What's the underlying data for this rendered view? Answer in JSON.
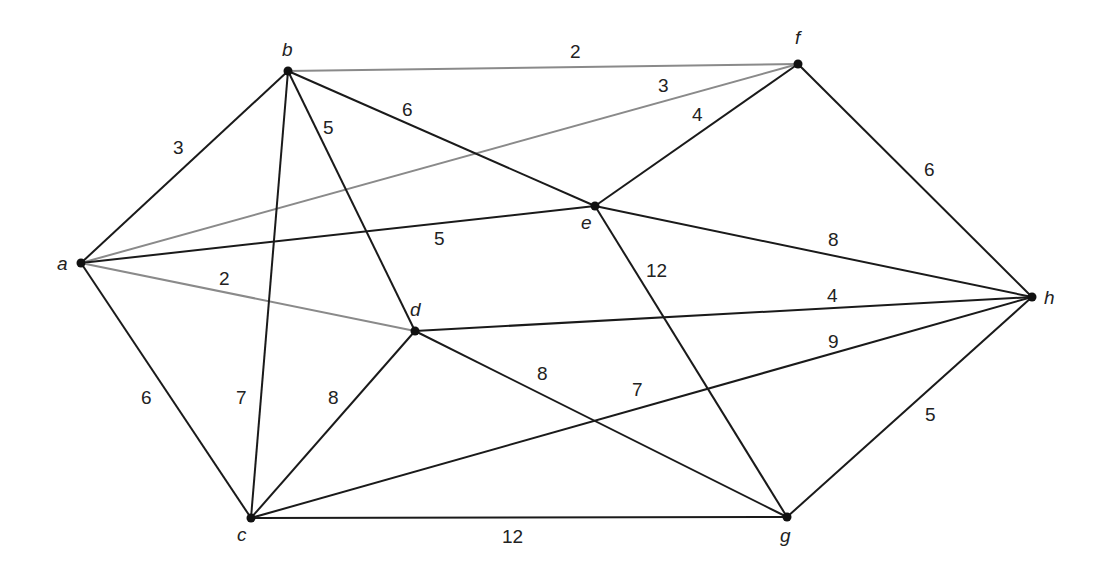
{
  "graph": {
    "type": "weighted-undirected-graph",
    "colors": {
      "edge_black": "#1a1a1a",
      "edge_gray": "#8a8a8a",
      "node": "#111111",
      "background": "#ffffff"
    },
    "nodes": [
      {
        "id": "a",
        "label": "a",
        "x": 81,
        "y": 263,
        "lx": 57,
        "ly": 270
      },
      {
        "id": "b",
        "label": "b",
        "x": 288,
        "y": 71,
        "lx": 282,
        "ly": 56
      },
      {
        "id": "c",
        "label": "c",
        "x": 251,
        "y": 518,
        "lx": 237,
        "ly": 541
      },
      {
        "id": "d",
        "label": "d",
        "x": 415,
        "y": 331,
        "lx": 410,
        "ly": 316
      },
      {
        "id": "e",
        "label": "e",
        "x": 595,
        "y": 206,
        "lx": 581,
        "ly": 229
      },
      {
        "id": "f",
        "label": "f",
        "x": 798,
        "y": 64,
        "lx": 795,
        "ly": 44
      },
      {
        "id": "g",
        "label": "g",
        "x": 787,
        "y": 517,
        "lx": 780,
        "ly": 542
      },
      {
        "id": "h",
        "label": "h",
        "x": 1032,
        "y": 297,
        "lx": 1044,
        "ly": 304
      }
    ],
    "edges": [
      {
        "from": "a",
        "to": "b",
        "weight": "3",
        "color": "black",
        "lx": 173,
        "ly": 154
      },
      {
        "from": "a",
        "to": "f",
        "weight": "3",
        "color": "gray",
        "lx": 658,
        "ly": 92
      },
      {
        "from": "a",
        "to": "e",
        "weight": "5",
        "color": "black",
        "lx": 434,
        "ly": 245
      },
      {
        "from": "a",
        "to": "d",
        "weight": "2",
        "color": "gray",
        "lx": 219,
        "ly": 285
      },
      {
        "from": "a",
        "to": "c",
        "weight": "6",
        "color": "black",
        "lx": 141,
        "ly": 404
      },
      {
        "from": "b",
        "to": "f",
        "weight": "2",
        "color": "gray",
        "lx": 570,
        "ly": 58
      },
      {
        "from": "b",
        "to": "e",
        "weight": "6",
        "color": "black",
        "lx": 402,
        "ly": 116
      },
      {
        "from": "b",
        "to": "d",
        "weight": "5",
        "color": "black",
        "lx": 323,
        "ly": 134
      },
      {
        "from": "b",
        "to": "c",
        "weight": "7",
        "color": "black",
        "lx": 236,
        "ly": 404
      },
      {
        "from": "f",
        "to": "e",
        "weight": "4",
        "color": "black",
        "lx": 692,
        "ly": 121
      },
      {
        "from": "f",
        "to": "h",
        "weight": "6",
        "color": "black",
        "lx": 924,
        "ly": 176
      },
      {
        "from": "e",
        "to": "h",
        "weight": "8",
        "color": "black",
        "lx": 828,
        "ly": 246
      },
      {
        "from": "e",
        "to": "g",
        "weight": "12",
        "color": "black",
        "lx": 646,
        "ly": 277
      },
      {
        "from": "d",
        "to": "h",
        "weight": "4",
        "color": "black",
        "lx": 827,
        "ly": 302
      },
      {
        "from": "d",
        "to": "c",
        "weight": "8",
        "color": "black",
        "lx": 328,
        "ly": 404
      },
      {
        "from": "d",
        "to": "g",
        "weight": "8",
        "color": "black",
        "lx": 537,
        "ly": 380
      },
      {
        "from": "c",
        "to": "h",
        "weight": "9",
        "color": "black",
        "lx": 828,
        "ly": 348
      },
      {
        "from": "c",
        "to": "g",
        "weight": "12",
        "color": "black",
        "lx": 502,
        "ly": 543
      },
      {
        "from": "g",
        "to": "h",
        "weight": "5",
        "color": "black",
        "lx": 925,
        "ly": 421
      }
    ],
    "extra_labels": [
      {
        "text": "7",
        "x": 632,
        "y": 396,
        "note": "label near crossing of c-h and d-g lines"
      }
    ]
  }
}
